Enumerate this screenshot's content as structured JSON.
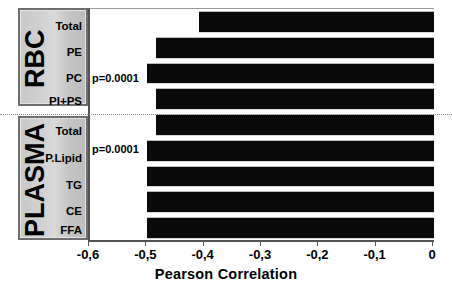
{
  "chart_data": {
    "type": "bar",
    "orientation": "horizontal",
    "title": "",
    "xlabel": "Pearson Correlation",
    "ylabel": "",
    "xlim": [
      -0.6,
      0
    ],
    "grid": false,
    "legend": null,
    "tick_labels": [
      "-0,6",
      "-0,5",
      "-0,4",
      "-0,3",
      "-0,2",
      "-0,1",
      "0"
    ],
    "tick_values": [
      -0.6,
      -0.5,
      -0.4,
      -0.3,
      -0.2,
      -0.1,
      0
    ],
    "categories": [
      "Total",
      "PE",
      "PC",
      "PI+PS",
      "Total",
      "P.Lipid",
      "TG",
      "CE",
      "FFA"
    ],
    "values": [
      -0.41,
      -0.485,
      -0.5,
      -0.485,
      -0.485,
      -0.5,
      -0.5,
      -0.5,
      -0.5
    ],
    "groups": [
      {
        "name": "RBC",
        "categories": [
          "Total",
          "PE",
          "PC",
          "PI+PS"
        ],
        "values": [
          -0.41,
          -0.485,
          -0.5,
          -0.485
        ]
      },
      {
        "name": "PLASMA",
        "categories": [
          "Total",
          "P.Lipid",
          "TG",
          "CE",
          "FFA"
        ],
        "values": [
          -0.485,
          -0.5,
          -0.5,
          -0.5,
          -0.5
        ]
      }
    ],
    "annotations": [
      {
        "text": "p=0.0001",
        "attached_to": "RBC / PC"
      },
      {
        "text": "p=0.0001",
        "attached_to": "PLASMA / P.Lipid"
      }
    ],
    "bar_color": "#0a0a0a",
    "panel_color": "#cfcfcf"
  },
  "axis": {
    "title": "Pearson Correlation",
    "ticks": [
      "-0,6",
      "-0,5",
      "-0,4",
      "-0,3",
      "-0,2",
      "-0,1",
      "0"
    ]
  },
  "groups": {
    "rbc": {
      "title": "RBC",
      "labels": [
        "Total",
        "PE",
        "PC",
        "PI+PS"
      ]
    },
    "plasma": {
      "title": "PLASMA",
      "labels": [
        "Total",
        "P.Lipid",
        "TG",
        "CE",
        "FFA"
      ]
    }
  },
  "annotations": {
    "p1": "p=0.0001",
    "p2": "p=0.0001"
  }
}
